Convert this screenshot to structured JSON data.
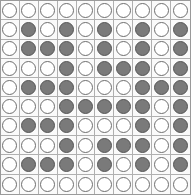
{
  "board": {
    "rows": 10,
    "cols": 10,
    "colors": {
      "light": "#ffffff",
      "dark": "#7a7a7a",
      "grid": "#b0b0b0"
    },
    "cells": [
      [
        "W",
        "W",
        "W",
        "W",
        "W",
        "W",
        "W",
        "W",
        "W",
        "W"
      ],
      [
        "W",
        "D",
        "W",
        "D",
        "W",
        "D",
        "W",
        "D",
        "W",
        "D"
      ],
      [
        "W",
        "D",
        "D",
        "D",
        "W",
        "D",
        "W",
        "D",
        "W",
        "D"
      ],
      [
        "W",
        "W",
        "W",
        "D",
        "W",
        "D",
        "D",
        "D",
        "W",
        "D"
      ],
      [
        "W",
        "D",
        "D",
        "D",
        "W",
        "W",
        "W",
        "D",
        "D",
        "D"
      ],
      [
        "W",
        "W",
        "W",
        "D",
        "D",
        "D",
        "D",
        "D",
        "W",
        "D"
      ],
      [
        "W",
        "D",
        "D",
        "D",
        "W",
        "W",
        "W",
        "D",
        "W",
        "D"
      ],
      [
        "W",
        "W",
        "W",
        "D",
        "W",
        "D",
        "D",
        "D",
        "W",
        "D"
      ],
      [
        "W",
        "D",
        "D",
        "D",
        "W",
        "D",
        "W",
        "D",
        "W",
        "D"
      ],
      [
        "W",
        "W",
        "W",
        "W",
        "W",
        "W",
        "W",
        "W",
        "W",
        "W"
      ]
    ]
  }
}
